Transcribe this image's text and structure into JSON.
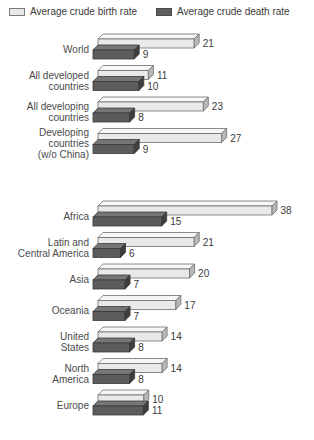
{
  "legend": {
    "birth": {
      "label": "Average crude birth rate",
      "swatch": "light-swatch-icon",
      "color": "#e8e8e8"
    },
    "death": {
      "label": "Average crude death rate",
      "swatch": "dark-swatch-icon",
      "color": "#5e5e5e"
    }
  },
  "chart_data": {
    "type": "bar",
    "orientation": "horizontal",
    "title": "",
    "xlabel": "",
    "ylabel": "",
    "xlim": [
      0,
      38
    ],
    "grid": false,
    "legend_position": "top",
    "categories": [
      "World",
      "All developed countries",
      "All developing countries",
      "Developing countries (w/o China)",
      "Africa",
      "Latin and Central America",
      "Asia",
      "Oceania",
      "United States",
      "North America",
      "Europe"
    ],
    "series": [
      {
        "name": "Average crude birth rate",
        "color": "#e8e8e8",
        "values": [
          21,
          11,
          23,
          27,
          38,
          21,
          20,
          17,
          14,
          14,
          10
        ]
      },
      {
        "name": "Average crude death rate",
        "color": "#5e5e5e",
        "values": [
          9,
          10,
          8,
          9,
          15,
          6,
          7,
          7,
          8,
          8,
          11
        ]
      }
    ],
    "groups": [
      {
        "name": "development-groups",
        "rows": [
          {
            "label_lines": [
              "World"
            ],
            "birth": 21,
            "death": 9
          },
          {
            "label_lines": [
              "All developed",
              "countries"
            ],
            "birth": 11,
            "death": 10
          },
          {
            "label_lines": [
              "All developing",
              "countries"
            ],
            "birth": 23,
            "death": 8
          },
          {
            "label_lines": [
              "Developing",
              "countries",
              "(w/o China)"
            ],
            "birth": 27,
            "death": 9
          }
        ]
      },
      {
        "name": "regions",
        "rows": [
          {
            "label_lines": [
              "Africa"
            ],
            "birth": 38,
            "death": 15
          },
          {
            "label_lines": [
              "Latin and",
              "Central America"
            ],
            "birth": 21,
            "death": 6
          },
          {
            "label_lines": [
              "Asia"
            ],
            "birth": 20,
            "death": 7
          },
          {
            "label_lines": [
              "Oceania"
            ],
            "birth": 17,
            "death": 7
          },
          {
            "label_lines": [
              "United",
              "States"
            ],
            "birth": 14,
            "death": 8
          },
          {
            "label_lines": [
              "North",
              "America"
            ],
            "birth": 14,
            "death": 8
          },
          {
            "label_lines": [
              "Europe"
            ],
            "birth": 10,
            "death": 11
          }
        ]
      }
    ]
  }
}
